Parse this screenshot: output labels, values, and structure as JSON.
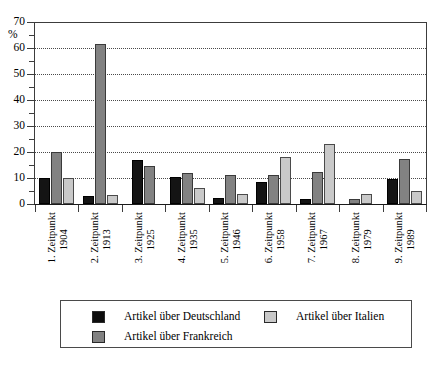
{
  "chart_data": {
    "type": "bar",
    "title": "",
    "xlabel": "",
    "ylabel": "%",
    "ylim": [
      0,
      70
    ],
    "ytick_step": 10,
    "yminor_step": 5,
    "grid": true,
    "grid_values": [
      10,
      20,
      30,
      40,
      50,
      60
    ],
    "ytick_labels": [
      "0",
      "10",
      "20",
      "30",
      "40",
      "50",
      "60",
      "70"
    ],
    "legend_position": "bottom",
    "categories": [
      "1. Zeitpunkt 1904",
      "2. Zeitpunkt 1913",
      "3. Zeitpunkt 1925",
      "4. Zeitpunkt 1935",
      "5. Zeitpunkt 1946",
      "6. Zeitpunkt 1958",
      "7. Zeitpunkt 1967",
      "8. Zeitpunkt 1979",
      "9. Zeitpunkt 1989"
    ],
    "category_lines": [
      [
        "1. Zeitpunkt",
        "1904"
      ],
      [
        "2. Zeitpunkt",
        "1913"
      ],
      [
        "3. Zeitpunkt",
        "1925"
      ],
      [
        "4. Zeitpunkt",
        "1935"
      ],
      [
        "5. Zeitpunkt",
        "1946"
      ],
      [
        "6. Zeitpunkt",
        "1958"
      ],
      [
        "7. Zeitpunkt",
        "1967"
      ],
      [
        "8. Zeitpunkt",
        "1979"
      ],
      [
        "9. Zeitpunkt",
        "1989"
      ]
    ],
    "series": [
      {
        "name": "Artikel über Deutschland",
        "color": "#141414",
        "values": [
          10,
          3,
          17,
          10.5,
          2.5,
          8.5,
          2,
          0,
          9.5
        ]
      },
      {
        "name": "Artikel über Frankreich",
        "color": "#828282",
        "values": [
          20,
          61.5,
          14.5,
          12,
          11,
          11,
          12.5,
          2,
          17.5
        ]
      },
      {
        "name": "Artikel über Italien",
        "color": "#c9c9c9",
        "values": [
          10,
          3.5,
          0,
          6,
          4,
          18,
          23,
          4,
          5
        ]
      }
    ]
  },
  "legend": {
    "entries": [
      {
        "label": "Artikel über Deutschland",
        "swatch": "s0"
      },
      {
        "label": "Artikel über Frankreich",
        "swatch": "s1"
      },
      {
        "label": "Artikel über Italien",
        "swatch": "s2"
      }
    ]
  }
}
